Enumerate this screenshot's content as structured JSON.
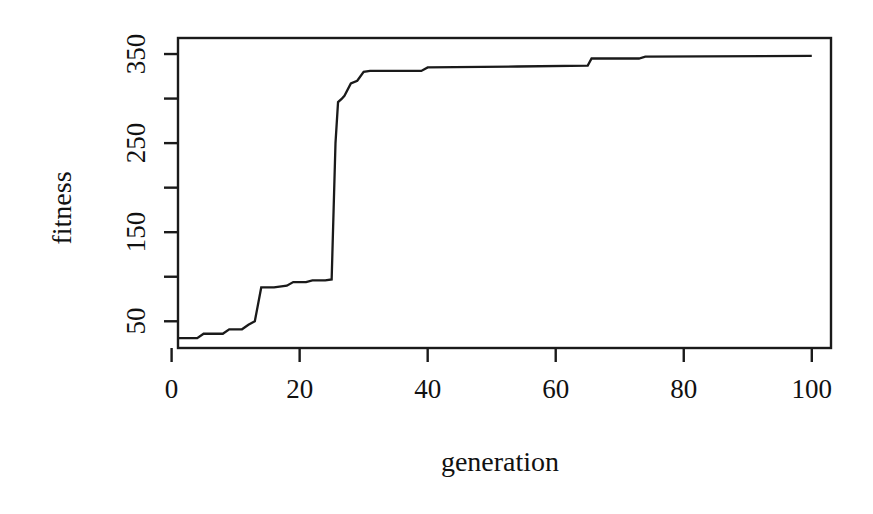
{
  "chart_data": {
    "type": "line",
    "title": "",
    "xlabel": "generation",
    "ylabel": "fitness",
    "xlim": [
      1,
      103
    ],
    "ylim": [
      20,
      368
    ],
    "grid": false,
    "legend": null,
    "xticks": [
      0,
      20,
      40,
      60,
      80,
      100
    ],
    "xtick_labels": [
      "0",
      "20",
      "40",
      "60",
      "80",
      "100"
    ],
    "yticks": [
      50,
      100,
      150,
      200,
      250,
      300,
      350
    ],
    "ytick_labels": [
      "50",
      "",
      "150",
      "",
      "250",
      "",
      "350"
    ],
    "ytick_labeled": [
      50,
      150,
      250,
      350
    ],
    "ytick_minor_unlabeled": [
      100,
      200,
      300
    ],
    "line_color": "#1a1a1a",
    "line_width": 2,
    "series": [
      {
        "name": "best fitness",
        "x": [
          1,
          4,
          5,
          8,
          9,
          11,
          12,
          13,
          14,
          16,
          18,
          19,
          21,
          22,
          24,
          25,
          25.6,
          26,
          26.6,
          27,
          28,
          29,
          30,
          31,
          39,
          40,
          54,
          65,
          65.6,
          73,
          74,
          100
        ],
        "y": [
          31,
          31,
          36,
          36,
          41,
          41,
          46,
          50,
          88,
          88,
          90,
          94,
          94,
          96,
          96,
          97,
          250,
          296,
          300,
          303,
          317,
          320,
          330,
          331,
          331,
          335,
          336,
          337,
          345,
          345,
          347,
          348
        ]
      }
    ],
    "annotations": []
  },
  "axes": {
    "frame": {
      "left_px": 178,
      "top_px": 38,
      "right_px": 831,
      "bottom_px": 348
    },
    "box_drawn": true,
    "tick_direction": "outward"
  }
}
